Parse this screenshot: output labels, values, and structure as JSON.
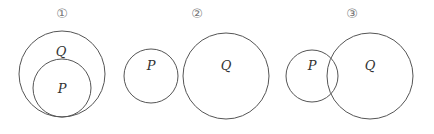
{
  "diagrams": [
    {
      "id": "1",
      "number_label": "①",
      "relation": "P subset of Q (P inside Q, internally tangent)",
      "sets": [
        {
          "name": "Q",
          "label": "Q",
          "cx": 62,
          "cy": 74,
          "r": 43,
          "label_x": 61,
          "label_y": 52
        },
        {
          "name": "P",
          "label": "P",
          "cx": 62,
          "cy": 88,
          "r": 29,
          "label_x": 62,
          "label_y": 89
        }
      ]
    },
    {
      "id": "2",
      "number_label": "②",
      "relation": "P and Q disjoint",
      "sets": [
        {
          "name": "P",
          "label": "P",
          "cx": 151,
          "cy": 76,
          "r": 27,
          "label_x": 151,
          "label_y": 70
        },
        {
          "name": "Q",
          "label": "Q",
          "cx": 226,
          "cy": 76,
          "r": 43,
          "label_x": 226,
          "label_y": 70
        }
      ]
    },
    {
      "id": "3",
      "number_label": "③",
      "relation": "P and Q overlap",
      "sets": [
        {
          "name": "P",
          "label": "P",
          "cx": 312,
          "cy": 76,
          "r": 26,
          "label_x": 312,
          "label_y": 70
        },
        {
          "name": "Q",
          "label": "Q",
          "cx": 370,
          "cy": 76,
          "r": 43,
          "label_x": 370,
          "label_y": 70
        }
      ]
    }
  ],
  "number_positions": [
    {
      "x": 62,
      "y": 18
    },
    {
      "x": 197,
      "y": 18
    },
    {
      "x": 352,
      "y": 18
    }
  ],
  "colors": {
    "stroke": "#555555",
    "text": "#333333",
    "number": "#777777"
  }
}
